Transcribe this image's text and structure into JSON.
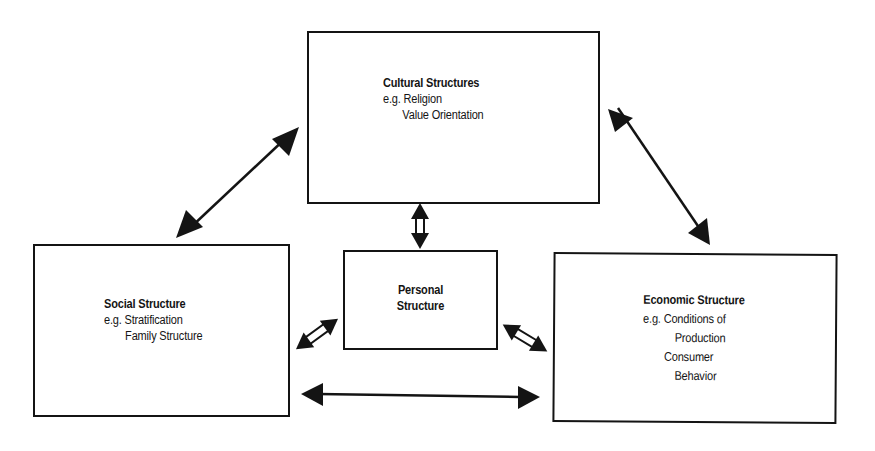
{
  "diagram": {
    "boxes": {
      "cultural": {
        "title": "Cultural Structures",
        "lines": [
          "e.g. Religion",
          "Value Orientation"
        ]
      },
      "social": {
        "title": "Social Structure",
        "lines": [
          "e.g. Stratification",
          "Family Structure"
        ]
      },
      "personal": {
        "title_line1": "Personal",
        "title_line2": "Structure"
      },
      "economic": {
        "title": "Economic Structure",
        "lines": [
          "e.g. Conditions of",
          "Production",
          "Consumer",
          "Behavior"
        ]
      }
    },
    "connections": [
      {
        "from": "social",
        "to": "cultural",
        "style": "solid-double-arrow"
      },
      {
        "from": "cultural",
        "to": "economic",
        "style": "solid-double-arrow"
      },
      {
        "from": "social",
        "to": "economic",
        "style": "solid-double-arrow"
      },
      {
        "from": "cultural",
        "to": "personal",
        "style": "hollow-double-arrow"
      },
      {
        "from": "social",
        "to": "personal",
        "style": "hollow-double-arrow"
      },
      {
        "from": "personal",
        "to": "economic",
        "style": "hollow-double-arrow"
      }
    ],
    "colors": {
      "stroke": "#141414",
      "background": "#ffffff"
    }
  }
}
